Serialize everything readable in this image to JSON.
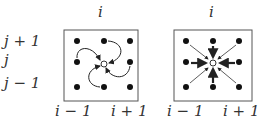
{
  "left_panel": {
    "top_label": "i",
    "row_labels": [
      "j + 1",
      "j",
      "j − 1"
    ],
    "bottom_labels": [
      "i − 1",
      "i + 1"
    ],
    "description": "curved arrows circulating toward center point"
  },
  "right_panel": {
    "top_label": "i",
    "bottom_labels": [
      "i − 1",
      "i + 1"
    ],
    "description": "straight arrows from 8 neighbors pointing to center point"
  },
  "colors": {
    "dot": "#111111",
    "frame": "#555555",
    "arrow": "#222222"
  }
}
